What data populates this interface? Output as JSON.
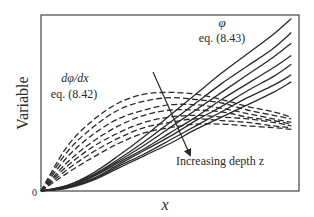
{
  "chart_data": {
    "type": "line",
    "title": "",
    "xlabel": "x",
    "ylabel": "Variable",
    "origin_label": "0",
    "xlim": [
      0,
      1
    ],
    "ylim": [
      0,
      1
    ],
    "grid": false,
    "legend": "none (inline labels)",
    "x": [
      0.0,
      0.1,
      0.2,
      0.3,
      0.4,
      0.5,
      0.6,
      0.7,
      0.8,
      0.9,
      0.97
    ],
    "series": [
      {
        "name": "phi z1",
        "group": "phi",
        "style": "solid",
        "values": [
          0.0,
          0.03,
          0.1,
          0.2,
          0.31,
          0.43,
          0.55,
          0.67,
          0.78,
          0.89,
          0.98
        ]
      },
      {
        "name": "phi z2",
        "group": "phi",
        "style": "solid",
        "values": [
          0.0,
          0.03,
          0.09,
          0.18,
          0.28,
          0.39,
          0.5,
          0.61,
          0.71,
          0.81,
          0.9
        ]
      },
      {
        "name": "phi z3",
        "group": "phi",
        "style": "solid",
        "values": [
          0.0,
          0.025,
          0.085,
          0.17,
          0.26,
          0.36,
          0.46,
          0.56,
          0.66,
          0.76,
          0.84
        ]
      },
      {
        "name": "phi z4",
        "group": "phi",
        "style": "solid",
        "values": [
          0.0,
          0.02,
          0.08,
          0.16,
          0.24,
          0.33,
          0.42,
          0.52,
          0.61,
          0.7,
          0.77
        ]
      },
      {
        "name": "phi z5",
        "group": "phi",
        "style": "solid",
        "values": [
          0.0,
          0.02,
          0.07,
          0.15,
          0.23,
          0.31,
          0.4,
          0.48,
          0.57,
          0.65,
          0.72
        ]
      },
      {
        "name": "phi z6",
        "group": "phi",
        "style": "solid",
        "values": [
          0.0,
          0.02,
          0.065,
          0.14,
          0.21,
          0.29,
          0.37,
          0.45,
          0.53,
          0.6,
          0.66
        ]
      },
      {
        "name": "phi z7",
        "group": "phi",
        "style": "solid",
        "values": [
          0.0,
          0.015,
          0.06,
          0.13,
          0.2,
          0.27,
          0.35,
          0.42,
          0.49,
          0.56,
          0.62
        ]
      },
      {
        "name": "dphi/dx z1",
        "group": "dphidx",
        "style": "dashed",
        "values": [
          0.0,
          0.25,
          0.4,
          0.5,
          0.55,
          0.56,
          0.55,
          0.52,
          0.48,
          0.45,
          0.42
        ]
      },
      {
        "name": "dphi/dx z2",
        "group": "dphidx",
        "style": "dashed",
        "values": [
          0.0,
          0.22,
          0.36,
          0.46,
          0.51,
          0.53,
          0.52,
          0.5,
          0.46,
          0.43,
          0.41
        ]
      },
      {
        "name": "dphi/dx z3",
        "group": "dphidx",
        "style": "dashed",
        "values": [
          0.0,
          0.19,
          0.32,
          0.41,
          0.46,
          0.49,
          0.49,
          0.47,
          0.44,
          0.41,
          0.39
        ]
      },
      {
        "name": "dphi/dx z4",
        "group": "dphidx",
        "style": "dashed",
        "values": [
          0.0,
          0.16,
          0.28,
          0.37,
          0.43,
          0.46,
          0.46,
          0.45,
          0.42,
          0.4,
          0.38
        ]
      },
      {
        "name": "dphi/dx z5",
        "group": "dphidx",
        "style": "dashed",
        "values": [
          0.0,
          0.14,
          0.25,
          0.33,
          0.39,
          0.42,
          0.43,
          0.42,
          0.41,
          0.39,
          0.37
        ]
      },
      {
        "name": "dphi/dx z6",
        "group": "dphidx",
        "style": "dashed",
        "values": [
          0.0,
          0.12,
          0.22,
          0.3,
          0.36,
          0.39,
          0.41,
          0.4,
          0.39,
          0.37,
          0.36
        ]
      },
      {
        "name": "dphi/dx z7",
        "group": "dphidx",
        "style": "dashed",
        "values": [
          0.0,
          0.1,
          0.19,
          0.27,
          0.33,
          0.36,
          0.38,
          0.38,
          0.37,
          0.36,
          0.35
        ]
      }
    ],
    "annotations": [
      {
        "text": "φ",
        "sub": "eq. (8.43)",
        "refers_to": "phi"
      },
      {
        "text": "dφ/dx",
        "sub": "eq. (8.42)",
        "refers_to": "dphidx"
      },
      {
        "text": "Increasing depth z",
        "type": "arrow",
        "from": [
          0.43,
          0.68
        ],
        "to": [
          0.58,
          0.2
        ]
      }
    ]
  },
  "labels": {
    "phi_symbol": "φ",
    "phi_eq": "eq. (8.43)",
    "dphi_symbol": "dφ/dx",
    "dphi_eq": "eq. (8.42)",
    "arrow_label": "Increasing depth z",
    "xlabel": "x",
    "ylabel": "Variable",
    "origin": "0"
  },
  "colors": {
    "line": "#2a2a2a",
    "frame": "#444444",
    "background": "#ffffff"
  }
}
